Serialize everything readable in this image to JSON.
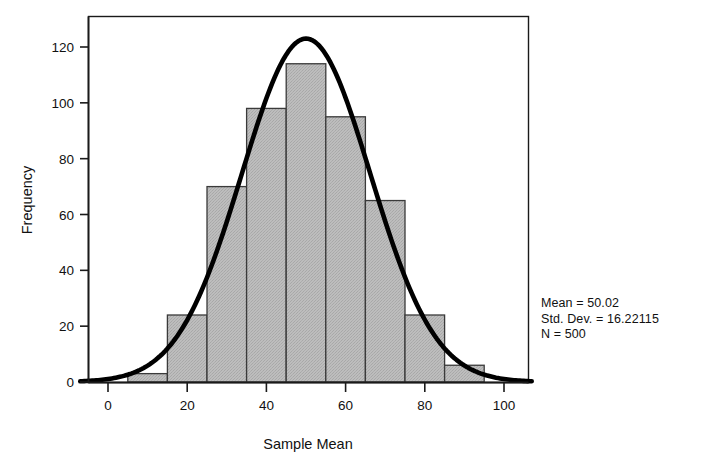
{
  "chart_data": {
    "type": "bar",
    "title": "",
    "subtitle": "",
    "xlabel": "Sample Mean",
    "ylabel": "Frequency",
    "xlim": [
      -7,
      107
    ],
    "ylim": [
      0,
      132
    ],
    "grid": false,
    "legend": "none",
    "bin_width": 10,
    "categories": [
      "5-15",
      "15-25",
      "25-35",
      "35-45",
      "45-55",
      "55-65",
      "65-75",
      "75-85",
      "85-95"
    ],
    "bin_edges": [
      5,
      15,
      25,
      35,
      45,
      55,
      65,
      75,
      85,
      95
    ],
    "bin_centers": [
      10,
      20,
      30,
      40,
      50,
      60,
      70,
      80,
      90
    ],
    "values": [
      3,
      24,
      70,
      98,
      114,
      95,
      65,
      24,
      6
    ],
    "xticks": [
      0,
      20,
      40,
      60,
      80,
      100
    ],
    "xtick_labels": [
      "0",
      "20",
      "40",
      "60",
      "80",
      "100"
    ],
    "yticks": [
      0,
      20,
      40,
      60,
      80,
      100,
      120
    ],
    "ytick_labels": [
      "0",
      "20",
      "40",
      "60",
      "80",
      "100",
      "120"
    ],
    "overlay": {
      "type": "line",
      "name": "normal-curve",
      "mean": 50.02,
      "std_dev": 16.22115,
      "peak_value": 123,
      "color": "#000000"
    },
    "series": [
      {
        "name": "Frequency",
        "values": [
          3,
          24,
          70,
          98,
          114,
          95,
          65,
          24,
          6
        ]
      }
    ],
    "colors": {
      "bar_fill": "#b5b5b5",
      "bar_border": "#3a3a3a",
      "curve": "#000000",
      "axis": "#1a1a1a",
      "frame": "#1a1a1a",
      "background": "#ffffff"
    }
  },
  "axes": {
    "x_title": "Sample Mean",
    "y_title": "Frequency"
  },
  "annotations": {
    "stats": {
      "mean_line": "Mean = 50.02",
      "std_dev_line": "Std. Dev. = 16.22115",
      "n_line": "N = 500",
      "mean_value": "50.02",
      "std_dev_value": "16.22115",
      "n_value": "500"
    }
  },
  "icons": {
    "chart_type": "histogram-icon"
  }
}
